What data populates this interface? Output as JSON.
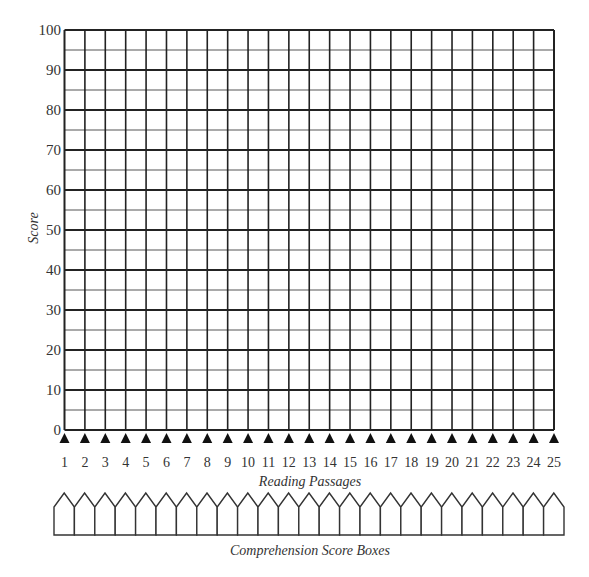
{
  "chart_data": {
    "type": "line",
    "title": "",
    "xlabel": "Reading Passages",
    "ylabel": "Score",
    "x": [
      1,
      2,
      3,
      4,
      5,
      6,
      7,
      8,
      9,
      10,
      11,
      12,
      13,
      14,
      15,
      16,
      17,
      18,
      19,
      20,
      21,
      22,
      23,
      24,
      25
    ],
    "y_ticks": [
      0,
      10,
      20,
      30,
      40,
      50,
      60,
      70,
      80,
      90,
      100
    ],
    "ylim": [
      0,
      100
    ],
    "minor_y_step": 5,
    "grid": true,
    "series": [],
    "footer_label": "Comprehension Score Boxes",
    "score_box_count": 25
  },
  "colors": {
    "major_line": "#222222",
    "minor_line": "#555555",
    "text": "#333333",
    "marker": "#111111"
  }
}
